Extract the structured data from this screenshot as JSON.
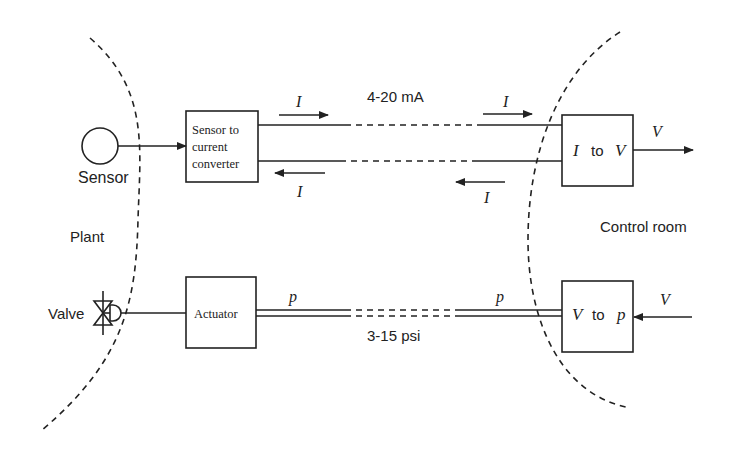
{
  "diagram": {
    "regions": {
      "plant_label": "Plant",
      "control_room_label": "Control room"
    },
    "current_loop": {
      "signal_range": "4-20 mA",
      "current_symbol": "I",
      "sensor_label": "Sensor",
      "converter_line1": "Sensor to",
      "converter_line2": "current",
      "converter_line3": "converter",
      "i_to_v_in": "I",
      "i_to_v_to": "to",
      "i_to_v_out": "V",
      "output_symbol": "V"
    },
    "pneumatic_loop": {
      "signal_range": "3-15 psi",
      "pressure_symbol": "p",
      "valve_label": "Valve",
      "actuator_label": "Actuator",
      "v_to_p_in": "V",
      "v_to_p_to": "to",
      "v_to_p_out": "p",
      "input_symbol": "V"
    },
    "colors": {
      "line": "#222222",
      "background": "#ffffff"
    }
  }
}
